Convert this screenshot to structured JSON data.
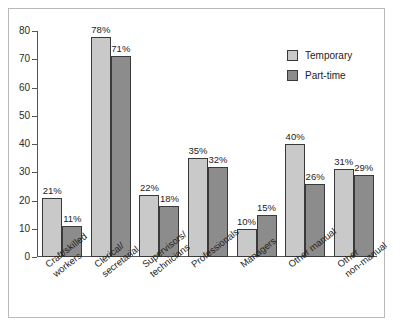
{
  "chart_data": {
    "type": "bar",
    "title": "",
    "xlabel": "",
    "ylabel": "",
    "ylim": [
      0,
      80
    ],
    "yticks": [
      0,
      10,
      20,
      30,
      40,
      50,
      60,
      70,
      80
    ],
    "grid": false,
    "legend_position": "top-right",
    "categories": [
      "Craft/skilled\nworkers",
      "Clerical/\nsecretarial",
      "Supervisors/\ntechnicians",
      "Professionals",
      "Managers",
      "Other manual",
      "Other\nnon-manual"
    ],
    "series": [
      {
        "name": "Temporary",
        "color": "#c9c9c9",
        "values": [
          21,
          78,
          22,
          35,
          10,
          40,
          31
        ],
        "labels": [
          "21%",
          "78%",
          "22%",
          "35%",
          "10%",
          "40%",
          "31%"
        ]
      },
      {
        "name": "Part-time",
        "color": "#8c8c8c",
        "values": [
          11,
          71,
          18,
          32,
          15,
          26,
          29
        ],
        "labels": [
          "11%",
          "71%",
          "18%",
          "32%",
          "15%",
          "26%",
          "29%"
        ]
      }
    ]
  },
  "axis": {
    "y_tick_labels": [
      "0",
      "10",
      "20",
      "30",
      "40",
      "50",
      "60",
      "70",
      "80"
    ]
  },
  "legend": {
    "items": [
      {
        "label": "Temporary"
      },
      {
        "label": "Part-time"
      }
    ]
  },
  "colors": {
    "temporary": "#c9c9c9",
    "parttime": "#8c8c8c",
    "axis": "#555555",
    "frame": "#b9b9b9",
    "text": "#232323"
  }
}
